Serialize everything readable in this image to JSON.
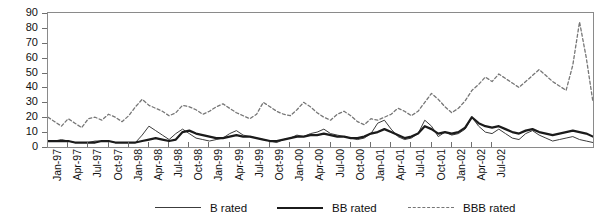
{
  "chart_data": {
    "type": "line",
    "title": "",
    "xlabel": "",
    "ylabel": "",
    "ylim": [
      0,
      90
    ],
    "ytick_step": 10,
    "yticks": [
      0,
      10,
      20,
      30,
      40,
      50,
      60,
      70,
      80,
      90
    ],
    "grid": false,
    "legend_position": "bottom",
    "x_tick_labels": [
      "Jan-97",
      "Apr-97",
      "Jul-97",
      "Oct-97",
      "Jan-98",
      "Apr-98",
      "Jul-98",
      "Oct-98",
      "Jan-99",
      "Apr-99",
      "Jul-99",
      "Oct-99",
      "Jan-00",
      "Apr-00",
      "Jul-00",
      "Oct-00",
      "Jan-01",
      "Apr-01",
      "Jul-01",
      "Oct-01",
      "Jan-02",
      "Apr-02",
      "Jul-02"
    ],
    "x_tick_interval_months": 3,
    "x_start": "Jan-97",
    "x_end": "Jul-02",
    "series": [
      {
        "name": "B rated",
        "style": "thin-solid",
        "color": "#3c3c3c",
        "values": [
          4,
          4,
          5,
          4,
          3,
          3,
          3,
          4,
          4,
          4,
          3,
          3,
          3,
          3,
          8,
          14,
          11,
          8,
          5,
          9,
          12,
          9,
          6,
          5,
          4,
          5,
          6,
          9,
          11,
          8,
          7,
          6,
          5,
          4,
          3,
          5,
          6,
          8,
          7,
          9,
          10,
          12,
          9,
          8,
          7,
          6,
          5,
          6,
          9,
          16,
          18,
          12,
          7,
          5,
          6,
          9,
          18,
          14,
          7,
          10,
          8,
          9,
          12,
          20,
          14,
          10,
          9,
          12,
          9,
          6,
          5,
          9,
          11,
          8,
          6,
          4,
          5,
          6,
          7,
          5,
          4,
          3
        ]
      },
      {
        "name": "BB rated",
        "style": "thick-solid",
        "color": "#1b1b1b",
        "values": [
          4,
          4,
          4,
          4,
          3,
          3,
          3,
          3,
          4,
          4,
          3,
          3,
          3,
          3,
          4,
          5,
          6,
          5,
          4,
          5,
          10,
          11,
          9,
          8,
          7,
          6,
          6,
          7,
          8,
          7,
          7,
          6,
          5,
          4,
          4,
          5,
          6,
          7,
          7,
          8,
          8,
          9,
          8,
          7,
          7,
          6,
          6,
          7,
          9,
          10,
          12,
          10,
          8,
          6,
          7,
          9,
          14,
          12,
          9,
          10,
          9,
          10,
          13,
          20,
          16,
          14,
          13,
          14,
          12,
          10,
          9,
          11,
          12,
          10,
          9,
          8,
          9,
          10,
          11,
          10,
          9,
          7
        ]
      },
      {
        "name": "BBB rated",
        "style": "dotted",
        "color": "#767676",
        "values": [
          20,
          17,
          14,
          19,
          16,
          13,
          19,
          20,
          18,
          22,
          20,
          17,
          21,
          27,
          32,
          28,
          26,
          24,
          21,
          23,
          28,
          27,
          25,
          22,
          24,
          27,
          29,
          26,
          23,
          21,
          19,
          22,
          30,
          27,
          24,
          22,
          21,
          25,
          30,
          27,
          23,
          20,
          18,
          22,
          24,
          21,
          17,
          15,
          19,
          18,
          20,
          22,
          26,
          24,
          21,
          24,
          30,
          36,
          32,
          27,
          23,
          26,
          31,
          38,
          42,
          47,
          44,
          49,
          46,
          43,
          40,
          44,
          48,
          52,
          48,
          44,
          41,
          38,
          55,
          84,
          60,
          30
        ]
      }
    ]
  },
  "legend": {
    "entries": [
      {
        "label": "B rated"
      },
      {
        "label": "BB rated"
      },
      {
        "label": "BBB rated"
      }
    ]
  },
  "axes": {
    "y_labels": [
      "90",
      "80",
      "70",
      "60",
      "50",
      "40",
      "30",
      "20",
      "10",
      "0"
    ]
  }
}
